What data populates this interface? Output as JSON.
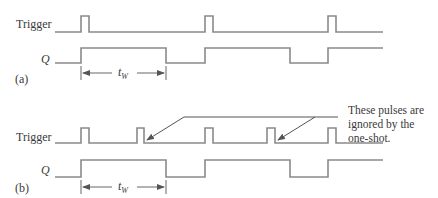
{
  "diagram": {
    "type": "timing-diagram",
    "colors": {
      "waveform": "#8a8a8a",
      "text": "#3a3a3a",
      "background": "#ffffff"
    },
    "part_a": {
      "label": "(a)",
      "signals": [
        {
          "name": "Trigger",
          "pulses_x": [
            [
              81,
              90
            ],
            [
              205,
              213
            ],
            [
              328,
              336
            ]
          ]
        },
        {
          "name": "Q",
          "high_intervals_x": [
            [
              81,
              166
            ],
            [
              205,
              290
            ],
            [
              328,
              383
            ]
          ]
        }
      ],
      "width_label": "t",
      "width_subscript": "W"
    },
    "part_b": {
      "label": "(b)",
      "signals": [
        {
          "name": "Trigger",
          "pulses_x": [
            [
              81,
              90
            ],
            [
              137,
              145
            ],
            [
              205,
              213
            ],
            [
              267,
              275
            ],
            [
              328,
              336
            ]
          ]
        },
        {
          "name": "Q",
          "high_intervals_x": [
            [
              81,
              166
            ],
            [
              205,
              290
            ],
            [
              328,
              383
            ]
          ]
        }
      ],
      "width_label": "t",
      "width_subscript": "W",
      "annotation": {
        "lines": [
          "These pulses are",
          "ignored by the",
          "one-shot."
        ]
      }
    }
  }
}
